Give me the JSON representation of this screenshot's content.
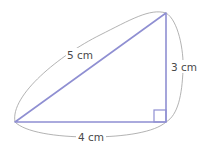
{
  "diagram": {
    "type": "right-triangle",
    "labels": {
      "hypotenuse": "5 cm",
      "vertical_side": "3 cm",
      "base": "4 cm"
    },
    "colors": {
      "triangle": "#8f8fd2",
      "arcs": "#a0a0a0",
      "text": "#4a4a4a"
    }
  }
}
